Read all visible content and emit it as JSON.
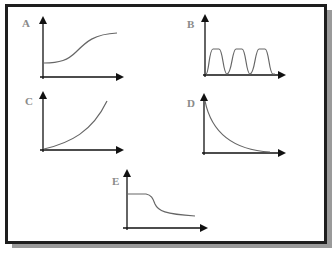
{
  "figure": {
    "colors": {
      "frame": "#1e1e1e",
      "shadow": "#9a9a9a",
      "axis": "#111111",
      "curve": "#666666",
      "label": "#8a8a8a"
    },
    "panels": [
      {
        "label": "A",
        "shape": "sigmoid-rise"
      },
      {
        "label": "B",
        "shape": "periodic-pulses"
      },
      {
        "label": "C",
        "shape": "exponential-growth"
      },
      {
        "label": "D",
        "shape": "exponential-decay"
      },
      {
        "label": "E",
        "shape": "sigmoid-fall"
      }
    ]
  }
}
